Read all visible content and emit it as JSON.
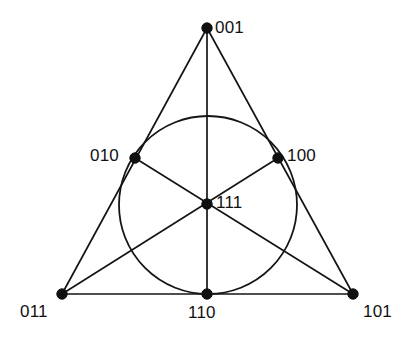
{
  "figure": {
    "kind": "fano-plane-incidence-diagram",
    "background_color": "#ffffff",
    "ink_color": "#151515",
    "width": 414,
    "height": 347
  },
  "chart_data": {
    "type": "diagram",
    "title": "",
    "xlabel": "",
    "ylabel": "",
    "grid": false,
    "legend": null,
    "nodes": [
      {
        "id": "n001",
        "label": "001",
        "x": 207,
        "y": 28,
        "label_x": 215,
        "label_y": 19,
        "label_anchor": "left"
      },
      {
        "id": "n010",
        "label": "010",
        "x": 135,
        "y": 158,
        "label_x": 90,
        "label_y": 147,
        "label_anchor": "left"
      },
      {
        "id": "n100",
        "label": "100",
        "x": 278,
        "y": 158,
        "label_x": 287,
        "label_y": 147,
        "label_anchor": "left"
      },
      {
        "id": "n111",
        "label": "111",
        "x": 207,
        "y": 204,
        "label_x": 216,
        "label_y": 194,
        "label_anchor": "left"
      },
      {
        "id": "n011",
        "label": "011",
        "x": 62,
        "y": 294,
        "label_x": 20,
        "label_y": 303,
        "label_anchor": "left"
      },
      {
        "id": "n110",
        "label": "110",
        "x": 207,
        "y": 294,
        "label_x": 188,
        "label_y": 304,
        "label_anchor": "left"
      },
      {
        "id": "n101",
        "label": "101",
        "x": 353,
        "y": 294,
        "label_x": 363,
        "label_y": 303,
        "label_anchor": "left"
      }
    ],
    "lines": [
      {
        "id": "L1",
        "name": "left-triangle-edge",
        "from": "001",
        "to": "011",
        "points": [
          [
            207,
            28
          ],
          [
            62,
            294
          ]
        ]
      },
      {
        "id": "L2",
        "name": "right-triangle-edge",
        "from": "001",
        "to": "101",
        "points": [
          [
            207,
            28
          ],
          [
            353,
            294
          ]
        ]
      },
      {
        "id": "L3",
        "name": "bottom-triangle-edge",
        "from": "011",
        "to": "101",
        "points": [
          [
            62,
            294
          ],
          [
            353,
            294
          ]
        ]
      },
      {
        "id": "L4",
        "name": "vertical-median",
        "from": "001",
        "to": "110",
        "points": [
          [
            207,
            28
          ],
          [
            207,
            294
          ]
        ]
      },
      {
        "id": "L5",
        "name": "median-010-101",
        "from": "010",
        "to": "101",
        "points": [
          [
            135,
            158
          ],
          [
            353,
            294
          ]
        ]
      },
      {
        "id": "L6",
        "name": "median-100-011",
        "from": "100",
        "to": "011",
        "points": [
          [
            278,
            158
          ],
          [
            62,
            294
          ]
        ]
      }
    ],
    "circle": {
      "id": "L7",
      "name": "inscribed-circle-line",
      "cx": 208,
      "cy": 205,
      "r": 89,
      "passes_through": [
        "010",
        "100",
        "110"
      ]
    }
  }
}
